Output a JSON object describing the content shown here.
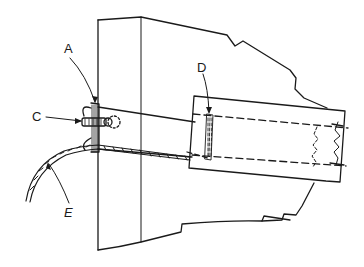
{
  "figure": {
    "type": "technical line drawing",
    "labels": [
      {
        "id": "A",
        "text": "A",
        "x": 64,
        "y": 42,
        "italic": false
      },
      {
        "id": "C",
        "text": "C",
        "x": 32,
        "y": 110,
        "italic": false
      },
      {
        "id": "D",
        "text": "D",
        "x": 197,
        "y": 61,
        "italic": false
      },
      {
        "id": "E",
        "text": "E",
        "x": 64,
        "y": 206,
        "italic": true
      }
    ],
    "colors": {
      "line": "#1a1a1a",
      "background": "#ffffff"
    }
  }
}
